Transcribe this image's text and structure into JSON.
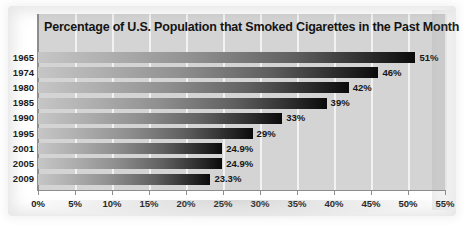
{
  "chart_data": {
    "type": "bar",
    "orientation": "horizontal",
    "title": "Percentage of U.S. Population that Smoked Cigarettes in the Past Month",
    "xlabel": "",
    "ylabel": "",
    "categories": [
      "1965",
      "1974",
      "1980",
      "1985",
      "1990",
      "1995",
      "2001",
      "2005",
      "2009"
    ],
    "values": [
      51,
      46,
      42,
      39,
      33,
      29,
      24.9,
      24.9,
      23.3
    ],
    "value_labels": [
      "51%",
      "46%",
      "42%",
      "39%",
      "33%",
      "29%",
      "24.9%",
      "24.9%",
      "23.3%"
    ],
    "xlim": [
      0,
      55
    ],
    "xtick_values": [
      0,
      5,
      10,
      15,
      20,
      25,
      30,
      35,
      40,
      45,
      50,
      55
    ],
    "xtick_labels": [
      "0%",
      "5%",
      "10%",
      "15%",
      "20%",
      "25%",
      "30%",
      "35%",
      "40%",
      "45%",
      "50%",
      "55%"
    ],
    "grid": "vertical",
    "legend": "none",
    "colors": {
      "bar_gradient_start": "#c6c6c6",
      "bar_gradient_end": "#0b0b0b",
      "plot_background": "#d4d4d4",
      "gridline": "#f2f2f2",
      "axis": "#8d8d8d",
      "text": "#161616",
      "page_background": "#ffffff"
    }
  }
}
